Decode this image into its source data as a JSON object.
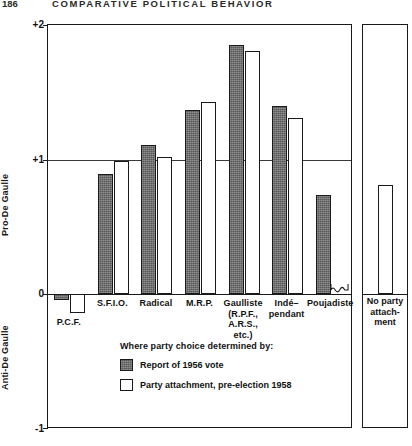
{
  "running_head": {
    "folio": "186",
    "title": "COMPARATIVE POLITICAL BEHAVIOR"
  },
  "chart_data": {
    "type": "bar",
    "title": "COMPARATIVE POLITICAL BEHAVIOR",
    "xlabel": "",
    "ylabel": "Pro-De Gaulle / Anti-De Gaulle",
    "ylim": [
      -1,
      2
    ],
    "yticks": [
      "+2",
      "+1",
      "0",
      "-1"
    ],
    "ytick_values": [
      2,
      1,
      0,
      -1
    ],
    "gridlines": [
      2,
      1,
      0
    ],
    "grid": true,
    "legend_position": "below-axes",
    "axis_label_top": "Pro-De Gaulle",
    "axis_label_bottom": "Anti-De Gaulle",
    "categories": [
      "P.C.F.",
      "S.F.I.O.",
      "Radical",
      "M.R.P.",
      "Gaulliste (R.P.F., A.R.S., etc.)",
      "Indé-pendant",
      "Poujadiste"
    ],
    "category_lines": [
      [
        "P.C.F."
      ],
      [
        "S.F.I.O."
      ],
      [
        "Radical"
      ],
      [
        "M.R.P."
      ],
      [
        "Gaulliste",
        "(R.P.F.,",
        "A.R.S.,",
        "etc.)"
      ],
      [
        "Indé–",
        "pendant"
      ],
      [
        "Poujadiste"
      ]
    ],
    "series": [
      {
        "name": "Report of 1956 vote",
        "style": "solid",
        "values": [
          -0.04,
          0.89,
          1.11,
          1.37,
          1.85,
          1.4,
          0.74
        ]
      },
      {
        "name": "Party attachment, pre-election 1958",
        "style": "open",
        "values": [
          -0.14,
          0.99,
          1.02,
          1.43,
          1.81,
          1.31,
          null
        ]
      }
    ],
    "no_data_marker": {
      "category": "Poujadiste",
      "series": "Party attachment, pre-election 1958",
      "symbol": "squiggle"
    },
    "side_panel": {
      "category": "No party attachment",
      "label_lines": [
        "No party",
        "attach-",
        "ment"
      ],
      "series": "Party attachment, pre-election 1958",
      "style": "open",
      "value": 0.81
    }
  },
  "legend": {
    "title": "Where party choice determined by:",
    "entries": [
      {
        "label": "Report of 1956 vote",
        "style": "solid"
      },
      {
        "label": "Party attachment, pre-election 1958",
        "style": "open"
      }
    ]
  },
  "colors": {
    "solid_fill": "#6b6b6b",
    "open_fill": "#ffffff",
    "stroke": "#1a1a1a",
    "gridline": "#3a3a3a"
  }
}
